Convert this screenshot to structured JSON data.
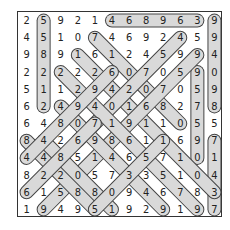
{
  "puzzle": {
    "type": "number-search",
    "rows": 12,
    "cols": 12,
    "grid": [
      [
        "2",
        "5",
        "9",
        "2",
        "1",
        "4",
        "6",
        "8",
        "9",
        "6",
        "3",
        "9"
      ],
      [
        "4",
        "5",
        "1",
        "0",
        "7",
        "4",
        "6",
        "9",
        "2",
        "4",
        "5",
        "9"
      ],
      [
        "9",
        "8",
        "9",
        "1",
        "6",
        "1",
        "2",
        "4",
        "5",
        "9",
        "9",
        "4"
      ],
      [
        "2",
        "2",
        "2",
        "2",
        "2",
        "6",
        "0",
        "7",
        "0",
        "5",
        "9",
        "0"
      ],
      [
        "5",
        "1",
        "1",
        "2",
        "9",
        "4",
        "2",
        "0",
        "7",
        "0",
        "5",
        "9"
      ],
      [
        "6",
        "2",
        "4",
        "9",
        "4",
        "0",
        "1",
        "6",
        "8",
        "2",
        "7",
        "8"
      ],
      [
        "6",
        "4",
        "8",
        "0",
        "7",
        "1",
        "9",
        "1",
        "1",
        "0",
        "5",
        "5"
      ],
      [
        "8",
        "4",
        "2",
        "6",
        "9",
        "8",
        "6",
        "1",
        "1",
        "6",
        "9",
        "7"
      ],
      [
        "4",
        "4",
        "8",
        "5",
        "1",
        "4",
        "6",
        "5",
        "7",
        "1",
        "0",
        "1"
      ],
      [
        "8",
        "2",
        "2",
        "0",
        "5",
        "7",
        "3",
        "3",
        "5",
        "1",
        "0",
        "4"
      ],
      [
        "6",
        "1",
        "5",
        "8",
        "8",
        "0",
        "9",
        "4",
        "6",
        "7",
        "8",
        "3"
      ],
      [
        "1",
        "9",
        "4",
        "9",
        "5",
        "1",
        "9",
        "2",
        "9",
        "1",
        "9",
        "7"
      ]
    ],
    "highlights": [
      {
        "from": [
          0,
          5
        ],
        "to": [
          0,
          10
        ]
      },
      {
        "from": [
          0,
          1
        ],
        "to": [
          5,
          1
        ]
      },
      {
        "from": [
          0,
          11
        ],
        "to": [
          5,
          11
        ]
      },
      {
        "from": [
          7,
          11
        ],
        "to": [
          11,
          11
        ]
      },
      {
        "from": [
          3,
          10
        ],
        "to": [
          8,
          10
        ]
      },
      {
        "from": [
          1,
          4
        ],
        "to": [
          6,
          9
        ]
      },
      {
        "from": [
          2,
          3
        ],
        "to": [
          10,
          11
        ]
      },
      {
        "from": [
          1,
          9
        ],
        "to": [
          7,
          3
        ]
      },
      {
        "from": [
          2,
          10
        ],
        "to": [
          11,
          1
        ]
      },
      {
        "from": [
          3,
          2
        ],
        "to": [
          11,
          10
        ]
      },
      {
        "from": [
          5,
          2
        ],
        "to": [
          11,
          8
        ]
      },
      {
        "from": [
          7,
          0
        ],
        "to": [
          11,
          4
        ]
      },
      {
        "from": [
          7,
          1
        ],
        "to": [
          11,
          5
        ]
      },
      {
        "from": [
          6,
          4
        ],
        "to": [
          10,
          0
        ]
      },
      {
        "from": [
          7,
          8
        ],
        "to": [
          11,
          4
        ]
      },
      {
        "from": [
          3,
          5
        ],
        "to": [
          8,
          0
        ]
      }
    ],
    "colors": {
      "highlight_fill": "#d9d9d9",
      "highlight_stroke": "#444444",
      "text": "#222222",
      "border": "#333333"
    }
  }
}
